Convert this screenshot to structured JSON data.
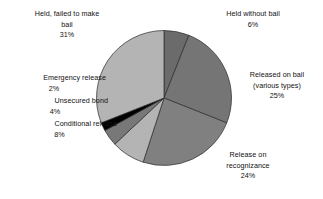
{
  "chart_data": {
    "type": "pie",
    "title": "",
    "subtitle": "",
    "xlabel": "",
    "ylabel": "",
    "legend_position": "none",
    "grid": false,
    "value_unit": "percent",
    "total": 100,
    "categories": [
      "Held without bail",
      "Released on bail (various types)",
      "Release on recognizance",
      "Conditional release",
      "Unsecured bond",
      "Emergency release",
      "Held, failed to make bail"
    ],
    "values": [
      6,
      25,
      24,
      8,
      4,
      2,
      31
    ],
    "colors": [
      "#6b6b6b",
      "#757575",
      "#808080",
      "#b4b4b4",
      "#787878",
      "#000000",
      "#b4b4b4"
    ],
    "slices": [
      {
        "label": "Held without bail",
        "value": 6,
        "value_label": "6%",
        "color": "#6b6b6b"
      },
      {
        "label": "Released on bail (various types)",
        "value": 25,
        "value_label": "25%",
        "color": "#757575"
      },
      {
        "label": "Release on recognizance",
        "value": 24,
        "value_label": "24%",
        "color": "#808080"
      },
      {
        "label": "Conditional release",
        "value": 8,
        "value_label": "8%",
        "color": "#b4b4b4"
      },
      {
        "label": "Unsecured bond",
        "value": 4,
        "value_label": "4%",
        "color": "#787878"
      },
      {
        "label": "Emergency release",
        "value": 2,
        "value_label": "2%",
        "color": "#000000"
      },
      {
        "label": "Held, failed to make bail",
        "value": 31,
        "value_label": "31%",
        "color": "#b4b4b4"
      }
    ]
  },
  "labels": {
    "held_failed": {
      "line1": "Held, failed to make",
      "line2": "bail",
      "pct": "31%"
    },
    "held_without": {
      "line1": "Held without bail",
      "pct": "6%"
    },
    "released_bail": {
      "line1": "Released on bail",
      "line2": "(various types)",
      "pct": "25%"
    },
    "release_recog": {
      "line1": "Release on",
      "line2": "recognizance",
      "pct": "24%"
    },
    "conditional": {
      "line1": "Conditional release",
      "pct": "8%"
    },
    "unsecured": {
      "line1": "Unsecured bond",
      "pct": "4%"
    },
    "emergency": {
      "line1": "Emergency release",
      "pct": "2%"
    }
  }
}
